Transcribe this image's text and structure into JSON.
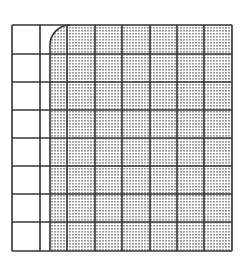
{
  "diagram": {
    "title": "",
    "grid": {
      "rows": 8,
      "cols": 8,
      "x_lines": [
        12,
        40,
        67,
        95,
        122,
        150,
        177,
        204,
        232
      ],
      "y_lines": [
        25,
        54,
        82,
        110,
        138,
        166,
        194,
        222,
        251
      ],
      "line_color": "#333333",
      "background": "#ffffff"
    },
    "shaded_region": {
      "x": 50,
      "y": 25,
      "width": 182,
      "height": 226,
      "corner_radius_top_left": 20,
      "fill_pattern": "stipple-dots",
      "dot_color": "#8c8c8c",
      "base_color": "#ffffff"
    }
  }
}
